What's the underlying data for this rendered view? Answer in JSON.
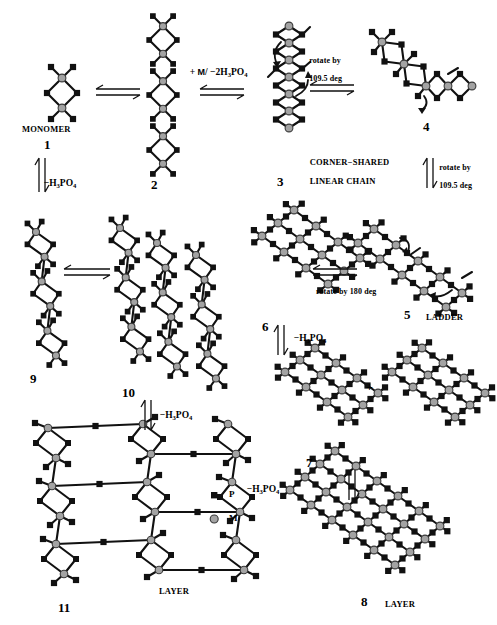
{
  "figure": {
    "type": "chemical-structure-diagram",
    "colors": {
      "phosphorus_marker": "#111111",
      "metal_marker": "#9a9a9a",
      "metal_marker_edge": "#333333",
      "bond": "#111111",
      "background": "#ffffff"
    }
  },
  "legend": {
    "items": [
      {
        "symbol": "square",
        "label": "P"
      },
      {
        "symbol": "circle",
        "label": "M"
      }
    ]
  },
  "structures": [
    {
      "id": "1",
      "number": "1",
      "caption": "MONOMER"
    },
    {
      "id": "2",
      "number": "2",
      "caption": ""
    },
    {
      "id": "3",
      "number": "3",
      "caption": "CORNER−SHARED\nLINEAR CHAIN"
    },
    {
      "id": "4",
      "number": "4",
      "caption": ""
    },
    {
      "id": "5",
      "number": "5",
      "caption": "LADDER"
    },
    {
      "id": "6",
      "number": "6",
      "caption": ""
    },
    {
      "id": "7",
      "number": "7",
      "caption": ""
    },
    {
      "id": "8",
      "number": "8",
      "caption": "LAYER"
    },
    {
      "id": "9",
      "number": "9",
      "caption": ""
    },
    {
      "id": "10",
      "number": "10",
      "caption": ""
    },
    {
      "id": "11",
      "number": "11",
      "caption": "LAYER"
    }
  ],
  "reactions": {
    "r1_2": {
      "label": "",
      "arrow": "double-horizontal"
    },
    "r2_3": {
      "label": "+ M/ −2H3PO4",
      "label_html": "+ M/ −2H",
      "label_sub": "3",
      "label_tail": "PO",
      "label_sub2": "4",
      "arrow": "double-horizontal"
    },
    "r1_9": {
      "label": "−H3PO4",
      "arrow": "double-vertical"
    },
    "r3_4": {
      "label": "rotate by\n109.5 deg",
      "arrow": "double-horizontal"
    },
    "r4_5": {
      "label": "rotate by\n109.5 deg",
      "arrow": "double-vertical"
    },
    "r5_6": {
      "label": "rotate by 180 deg",
      "arrow": "double-horizontal"
    },
    "r6_7": {
      "label": "−H3PO4",
      "arrow": "double-vertical"
    },
    "r7_8": {
      "label": "−H3PO4",
      "arrow": "double-vertical"
    },
    "r9_10": {
      "label": "",
      "arrow": "double-horizontal"
    },
    "r10_11": {
      "label": "−H3PO4",
      "arrow": "double-vertical"
    },
    "plus_7": {
      "label": "+"
    }
  },
  "text_labels": {
    "monomer": "MONOMER",
    "corner_shared": "CORNER−SHARED",
    "linear_chain": "LINEAR CHAIN",
    "ladder": "LADDER",
    "layer_8": "LAYER",
    "layer_11": "LAYER",
    "rotate_109_a_l1": "rotate by",
    "rotate_109_a_l2": "109.5 deg",
    "rotate_109_b_l1": "rotate by",
    "rotate_109_b_l2": "109.5 deg",
    "rotate_180": "rotate by 180 deg",
    "plus": "+",
    "n1": "1",
    "n2": "2",
    "n3": "3",
    "n4": "4",
    "n5": "5",
    "n6": "6",
    "n7": "7",
    "n8": "8",
    "n9": "9",
    "n10": "10",
    "n11": "11",
    "legend_p": "P",
    "legend_m": "M"
  },
  "formulas": {
    "minus_h3po4": {
      "pre": "−H",
      "sub1": "3",
      "mid": "PO",
      "sub2": "4"
    },
    "plus_m_minus_2h3po4": {
      "pre": "+ ",
      "m": "M",
      "slash": "/ −2H",
      "sub1": "3",
      "mid": "PO",
      "sub2": "4"
    }
  }
}
